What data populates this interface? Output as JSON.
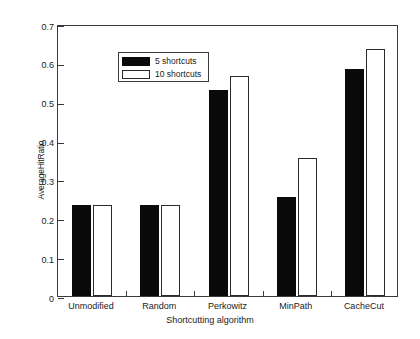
{
  "chart_data": {
    "type": "bar",
    "title": "",
    "xlabel": "Shortcutting algorithm",
    "ylabel": "AverageHitRatio",
    "categories": [
      "Unmodified",
      "Random",
      "Perkowitz",
      "MinPath",
      "CacheCut"
    ],
    "series": [
      {
        "name": "5 shortcuts",
        "color": "#0a0a0a",
        "values": [
          0.235,
          0.235,
          0.53,
          0.255,
          0.585
        ]
      },
      {
        "name": "10 shortcuts",
        "color": "#ffffff",
        "values": [
          0.235,
          0.235,
          0.565,
          0.355,
          0.635
        ]
      }
    ],
    "ylim": [
      0,
      0.7
    ],
    "yticks": [
      "0",
      "0.1",
      "0.2",
      "0.3",
      "0.4",
      "0.5",
      "0.6",
      "0.7"
    ],
    "ytick_values": [
      0,
      0.1,
      0.2,
      0.3,
      0.4,
      0.5,
      0.6,
      0.7
    ],
    "grid": false,
    "legend_position": "upper-left"
  }
}
